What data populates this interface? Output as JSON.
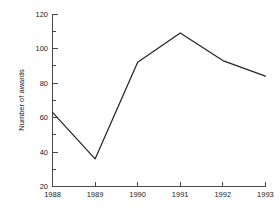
{
  "chart_data": {
    "type": "line",
    "title": "",
    "subtitle": "",
    "xlabel": "",
    "ylabel": "Number of awards",
    "categories": [
      "1988",
      "1989",
      "1990",
      "1991",
      "1992",
      "1993"
    ],
    "x": [
      1988,
      1989,
      1990,
      1991,
      1992,
      1993
    ],
    "values": [
      63,
      36,
      92,
      109,
      93,
      84
    ],
    "series": [
      {
        "name": "Number of awards",
        "values": [
          63,
          36,
          92,
          109,
          93,
          84
        ]
      }
    ],
    "xlim": [
      1988,
      1993
    ],
    "ylim": [
      20,
      120
    ],
    "y_ticks": [
      20,
      40,
      60,
      80,
      100,
      120
    ],
    "y_tick_labels": [
      "20",
      "40",
      "60",
      "80",
      "100",
      "120"
    ],
    "y_minor_ticks": [
      30,
      50,
      70,
      90,
      110
    ],
    "x_ticks": [
      1988,
      1989,
      1990,
      1991,
      1992,
      1993
    ],
    "x_tick_labels": [
      "1988",
      "1989",
      "1990",
      "1991",
      "1992",
      "1993"
    ],
    "grid": false,
    "legend": false,
    "legend_position": "none",
    "line_color": "#262626",
    "axis_color": "#4a4a4a",
    "background_color": "#ffffff",
    "spines": [
      "left",
      "bottom"
    ],
    "tick_direction": "in",
    "markers": false,
    "annotations": []
  }
}
